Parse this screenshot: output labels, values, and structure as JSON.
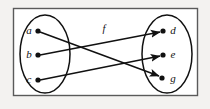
{
  "figure": {
    "kind": "function-mapping-diagram",
    "function_label": "f",
    "frame": {
      "outer_background": "#f3f2f0",
      "panel_background": "#ffffff",
      "border_color": "#5a5a5a",
      "x": 13,
      "y": 8,
      "width": 184,
      "height": 87
    },
    "domain_set": {
      "name": "domain",
      "cx": 45,
      "cy": 54,
      "rx": 25,
      "ry": 39,
      "elements": [
        {
          "id": "a",
          "label": "a",
          "x": 38,
          "y": 31,
          "label_x": 29,
          "label_y": 34
        },
        {
          "id": "b",
          "label": "b",
          "x": 38,
          "y": 55,
          "label_x": 29,
          "label_y": 58
        },
        {
          "id": "c",
          "label": "c",
          "x": 38,
          "y": 80,
          "label_x": 29,
          "label_y": 83
        }
      ]
    },
    "codomain_set": {
      "name": "codomain",
      "cx": 167,
      "cy": 54,
      "rx": 25,
      "ry": 39,
      "elements": [
        {
          "id": "d",
          "label": "d",
          "x": 163,
          "y": 31,
          "label_x": 173,
          "label_y": 34
        },
        {
          "id": "e",
          "label": "e",
          "x": 163,
          "y": 55,
          "label_x": 173,
          "label_y": 58
        },
        {
          "id": "g",
          "label": "g",
          "x": 162,
          "y": 78,
          "label_x": 173,
          "label_y": 82
        }
      ]
    },
    "mappings": [
      {
        "from": "a",
        "to": "g",
        "x1": 40,
        "y1": 32,
        "x2": 159,
        "y2": 76
      },
      {
        "from": "b",
        "to": "d",
        "x1": 40,
        "y1": 55,
        "x2": 160,
        "y2": 32
      },
      {
        "from": "c",
        "to": "e",
        "x1": 40,
        "y1": 80,
        "x2": 160,
        "y2": 56
      }
    ],
    "function_label_pos": {
      "x": 104,
      "y": 32
    },
    "stroke_color": "#111111",
    "dot_radius": 2.6
  }
}
